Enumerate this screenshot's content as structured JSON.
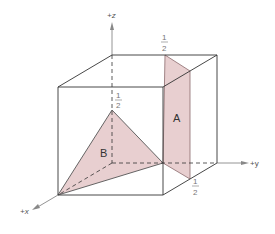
{
  "figure": {
    "type": "unit-cell-crystallographic-planes",
    "axes": {
      "z": "+z",
      "y": "+y",
      "x": "+x"
    },
    "planes": [
      {
        "label": "A",
        "fill": "#e8cfd0"
      },
      {
        "label": "B",
        "fill": "#e8cfd0"
      }
    ],
    "intercept_labels": {
      "z_intercept": {
        "num": "1",
        "den": "2"
      },
      "top_y_intercept": {
        "num": "1",
        "den": "2"
      },
      "bottom_y_intercept": {
        "num": "1",
        "den": "2"
      }
    },
    "colors": {
      "edge": "#333333",
      "axis": "#888888",
      "plane_fill": "#e8cfd0",
      "plane_edge": "#8a6a6c"
    }
  }
}
